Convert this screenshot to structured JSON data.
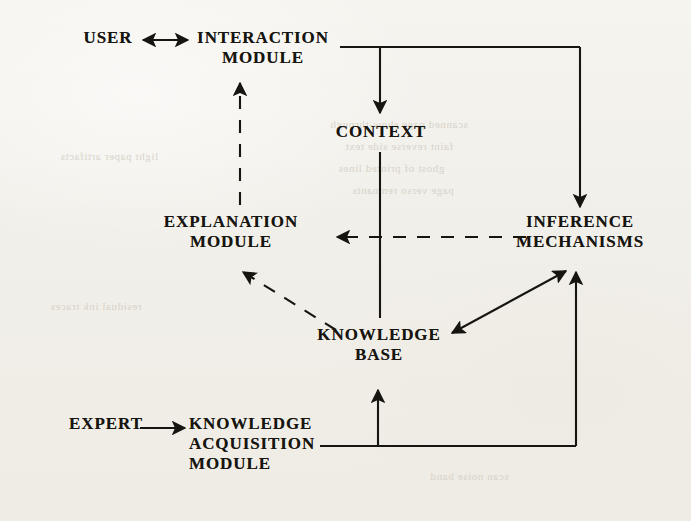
{
  "figure": {
    "type": "block-diagram",
    "background_color": "#f1efe9",
    "ink_color": "#17150f",
    "nodes": [
      {
        "id": "user",
        "label": "USER",
        "x": 108,
        "y": 38,
        "align": "center"
      },
      {
        "id": "interaction",
        "label": "INTERACTION\nMODULE",
        "x": 263,
        "y": 38,
        "align": "center"
      },
      {
        "id": "context",
        "label": "CONTEXT",
        "x": 381,
        "y": 132,
        "align": "center"
      },
      {
        "id": "explanation",
        "label": "EXPLANATION\nMODULE",
        "x": 231,
        "y": 222,
        "align": "center"
      },
      {
        "id": "inference",
        "label": "INFERENCE\nMECHANISMS",
        "x": 580,
        "y": 222,
        "align": "center"
      },
      {
        "id": "knowledge",
        "label": "KNOWLEDGE\nBASE",
        "x": 379,
        "y": 335,
        "align": "center"
      },
      {
        "id": "expert",
        "label": "EXPERT",
        "x": 106,
        "y": 424,
        "align": "center"
      },
      {
        "id": "acquisition",
        "label": "KNOWLEDGE\nACQUISITION\nMODULE",
        "x": 253,
        "y": 424,
        "align": "center"
      }
    ],
    "edges": [
      {
        "id": "user-interaction",
        "from": "user",
        "to": "interaction",
        "style": "solid",
        "arrow": "both"
      },
      {
        "id": "interaction-context",
        "from": "interaction",
        "to": "context",
        "style": "solid",
        "arrow": "end"
      },
      {
        "id": "interaction-inference",
        "from": "interaction",
        "to": "inference",
        "style": "solid",
        "arrow": "end"
      },
      {
        "id": "context-knowledge",
        "from": "context",
        "to": "knowledge",
        "style": "solid",
        "arrow": "none"
      },
      {
        "id": "inference-explanation",
        "from": "inference",
        "to": "explanation",
        "style": "dashed",
        "arrow": "end"
      },
      {
        "id": "explanation-interaction",
        "from": "explanation",
        "to": "interaction",
        "style": "dashed",
        "arrow": "end"
      },
      {
        "id": "knowledge-explanation",
        "from": "knowledge",
        "to": "explanation",
        "style": "dashed",
        "arrow": "end"
      },
      {
        "id": "knowledge-inference",
        "from": "knowledge",
        "to": "inference",
        "style": "solid",
        "arrow": "both"
      },
      {
        "id": "expert-acquisition",
        "from": "expert",
        "to": "acquisition",
        "style": "solid",
        "arrow": "end"
      },
      {
        "id": "acquisition-knowledge",
        "from": "acquisition",
        "to": "knowledge",
        "style": "solid",
        "arrow": "end"
      },
      {
        "id": "acquisition-inference",
        "from": "acquisition",
        "to": "inference",
        "style": "solid",
        "arrow": "end"
      }
    ]
  },
  "bleedthrough": [
    {
      "text": "scanned page show-through",
      "x": 330,
      "y": 118
    },
    {
      "text": "faint reverse side text",
      "x": 345,
      "y": 140
    },
    {
      "text": "ghost of printed lines",
      "x": 338,
      "y": 162
    },
    {
      "text": "page verso remnants",
      "x": 352,
      "y": 184
    },
    {
      "text": "light paper artifacts",
      "x": 60,
      "y": 150
    },
    {
      "text": "residual ink traces",
      "x": 50,
      "y": 300
    },
    {
      "text": "scan noise band",
      "x": 430,
      "y": 470
    }
  ]
}
